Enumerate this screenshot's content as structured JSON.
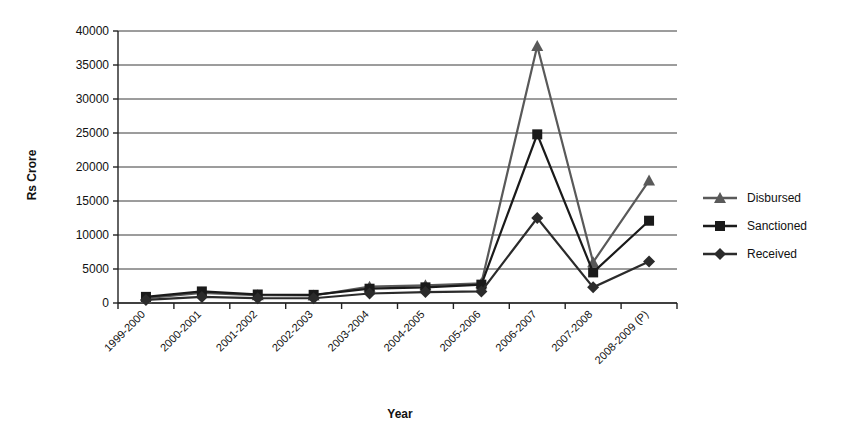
{
  "chart_data": {
    "type": "line",
    "title": "",
    "xlabel": "Year",
    "ylabel": "Rs Crore",
    "categories": [
      "1999-2000",
      "2000-2001",
      "2001-2002",
      "2002-2003",
      "2003-2004",
      "2004-2005",
      "2005-2006",
      "2006-2007",
      "2007-2008",
      "2008-2009 (P)"
    ],
    "ylim": [
      0,
      40000
    ],
    "ytick_values": [
      0,
      5000,
      10000,
      15000,
      20000,
      25000,
      30000,
      35000,
      40000
    ],
    "ytick_labels": [
      "0",
      "5000",
      "10000",
      "15000",
      "20000",
      "25000",
      "30000",
      "35000",
      "40000"
    ],
    "grid": true,
    "legend_position": "right",
    "series": [
      {
        "name": "Disbursed",
        "marker": "triangle",
        "color": "#595959",
        "values": [
          700,
          1500,
          1150,
          1100,
          2400,
          2600,
          2900,
          37800,
          6000,
          18000
        ]
      },
      {
        "name": "Sanctioned",
        "marker": "square",
        "color": "#1a1a1a",
        "values": [
          900,
          1700,
          1250,
          1200,
          2100,
          2300,
          2700,
          24800,
          4500,
          12100
        ]
      },
      {
        "name": "Received",
        "marker": "diamond",
        "color": "#2b2b2b",
        "values": [
          450,
          900,
          700,
          700,
          1400,
          1600,
          1700,
          12500,
          2300,
          6100
        ]
      }
    ]
  },
  "axes": {
    "y_axis_title": "Rs Crore",
    "x_axis_title": "Year"
  },
  "legend": {
    "items": [
      {
        "label": "Disbursed",
        "marker": "triangle-marker-icon"
      },
      {
        "label": "Sanctioned",
        "marker": "square-marker-icon"
      },
      {
        "label": "Received",
        "marker": "diamond-marker-icon"
      }
    ]
  },
  "colors": {
    "disbursed": "#595959",
    "sanctioned": "#1a1a1a",
    "received": "#2b2b2b",
    "grid": "#3a3a3a",
    "axis": "#222222",
    "background": "#ffffff"
  }
}
